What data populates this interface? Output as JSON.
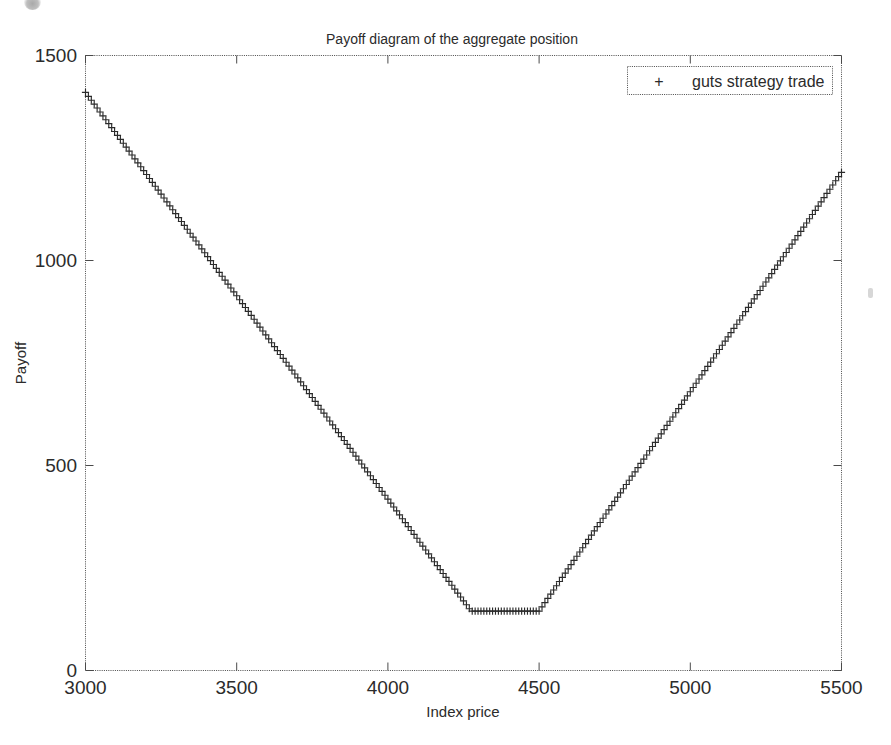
{
  "figure": {
    "title": "Payoff diagram of the aggregate position",
    "background_color": "#ffffff",
    "ink_color": "#2b2b2b"
  },
  "legend": {
    "position": "top-right",
    "marker_glyph": "+",
    "entries": [
      {
        "label": "guts strategy trade",
        "marker": "plus-marker",
        "color": "#2b2b2b"
      }
    ]
  },
  "axes": {
    "x": {
      "label": "Index price",
      "ticks": [
        "3000",
        "3500",
        "4000",
        "4500",
        "5000",
        "5500"
      ],
      "min": 3000,
      "max": 5500
    },
    "y": {
      "label": "Payoff",
      "ticks": [
        "0",
        "500",
        "1000",
        "1500"
      ],
      "min": 0,
      "max": 1500
    }
  },
  "chart_data": {
    "type": "line",
    "title": "Payoff diagram of the aggregate position",
    "xlabel": "Index price",
    "ylabel": "Payoff",
    "xlim": [
      3000,
      5500
    ],
    "ylim": [
      0,
      1500
    ],
    "xticks": [
      3000,
      3500,
      4000,
      4500,
      5000,
      5500
    ],
    "yticks": [
      0,
      500,
      1000,
      1500
    ],
    "grid": false,
    "legend_position": "upper right",
    "marker": "+",
    "series": [
      {
        "name": "guts strategy trade",
        "color": "#2b2b2b",
        "marker": "+",
        "linestyle": "none",
        "breakpoints": [
          {
            "x": 3000,
            "y": 1410
          },
          {
            "x": 4275,
            "y": 145
          },
          {
            "x": 4500,
            "y": 145
          },
          {
            "x": 5500,
            "y": 1215
          }
        ],
        "x": [
          3000,
          3100,
          3200,
          3300,
          3400,
          3500,
          3600,
          3700,
          3800,
          3900,
          4000,
          4100,
          4200,
          4275,
          4350,
          4425,
          4500,
          4600,
          4700,
          4800,
          4900,
          5000,
          5100,
          5200,
          5300,
          5400,
          5500
        ],
        "y": [
          1410,
          1311,
          1212,
          1112,
          1013,
          914,
          814,
          715,
          616,
          516,
          417,
          318,
          218,
          145,
          145,
          145,
          145,
          252,
          359,
          466,
          573,
          680,
          787,
          894,
          1001,
          1108,
          1215
        ]
      }
    ],
    "annotations": []
  }
}
